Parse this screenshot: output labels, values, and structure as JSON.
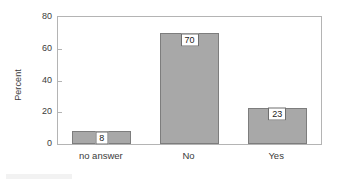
{
  "chart_data": {
    "type": "bar",
    "title": "",
    "subtitle": "",
    "xlabel": "",
    "ylabel": "Percent",
    "categories": [
      "no answer",
      "No",
      "Yes"
    ],
    "values": [
      8,
      70,
      23
    ],
    "value_labels": [
      "8",
      "70",
      "23"
    ],
    "ylim": [
      0,
      80
    ],
    "yticks": [
      0,
      20,
      40,
      60,
      80
    ],
    "ytick_labels": [
      "0",
      "20",
      "40",
      "60",
      "80"
    ],
    "grid": false,
    "legend": false,
    "legend_position": "none",
    "bar_fill_color": "#a8a8a8",
    "bar_edge_color": "#7d7d7d",
    "frame_color": "#b4b4b4",
    "text_color": "#3b3b3b",
    "background_color": "#ffffff"
  }
}
